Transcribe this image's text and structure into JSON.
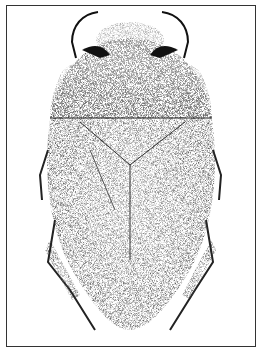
{
  "figure": {
    "style": "stipple ink illustration",
    "colors": {
      "ink": "#1a1a1a",
      "paper": "#ffffff",
      "frame": "#333333"
    }
  }
}
